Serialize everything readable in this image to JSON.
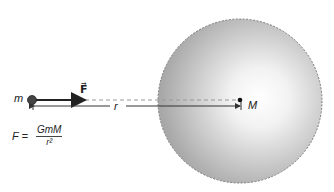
{
  "diagram": {
    "labels": {
      "small_mass": "m",
      "large_mass": "M",
      "force_vector": "F⃗",
      "distance": "r"
    },
    "formula": {
      "lhs": "F =",
      "numerator": "GmM",
      "denominator": "r²"
    },
    "colors": {
      "sphere_edge": "#8a8a8a",
      "sphere_center": "#ffffff",
      "sphere_outer": "#a9a9a9",
      "arrow": "#222222",
      "dashed_line": "#999999"
    }
  }
}
